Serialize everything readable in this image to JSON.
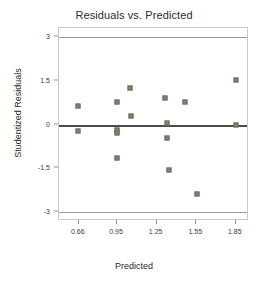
{
  "chart_data": {
    "type": "scatter",
    "title": "Residuals vs. Predicted",
    "xlabel": "Predicted",
    "ylabel": "Studentized Residuals",
    "xlim": [
      0.51,
      1.95
    ],
    "ylim": [
      -3.3,
      3.3
    ],
    "grid": false,
    "legend": null,
    "xticks": [
      0.66,
      0.95,
      1.25,
      1.55,
      1.85
    ],
    "xtick_labels": [
      "0.66",
      "0.95",
      "1.25",
      "1.55",
      "1.85"
    ],
    "yticks": [
      3,
      1.5,
      0,
      -1.5,
      -3
    ],
    "ytick_labels": [
      "3",
      "1.5",
      "0",
      "-1.5",
      "-3"
    ],
    "reference_lines": [
      {
        "name": "upper-limit",
        "y": 3,
        "color": "#9a9a9a"
      },
      {
        "name": "zero-line",
        "y": 0,
        "color": "#4a4a4a"
      },
      {
        "name": "lower-limit",
        "y": -3,
        "color": "#9a9a9a"
      }
    ],
    "marker_color": "#8a8276",
    "points": [
      {
        "x": 0.655,
        "y": 0.62
      },
      {
        "x": 0.655,
        "y": -0.22
      },
      {
        "x": 0.952,
        "y": 0.76
      },
      {
        "x": 0.952,
        "y": -0.18
      },
      {
        "x": 0.952,
        "y": -0.3
      },
      {
        "x": 0.948,
        "y": -1.14
      },
      {
        "x": 1.048,
        "y": 1.26
      },
      {
        "x": 1.058,
        "y": 0.3
      },
      {
        "x": 1.312,
        "y": 0.9
      },
      {
        "x": 1.33,
        "y": 0.04
      },
      {
        "x": 1.326,
        "y": -0.46
      },
      {
        "x": 1.342,
        "y": -1.56
      },
      {
        "x": 1.462,
        "y": 0.76
      },
      {
        "x": 1.558,
        "y": -2.36
      },
      {
        "x": 1.848,
        "y": 1.52
      },
      {
        "x": 1.852,
        "y": -0.02
      }
    ]
  }
}
